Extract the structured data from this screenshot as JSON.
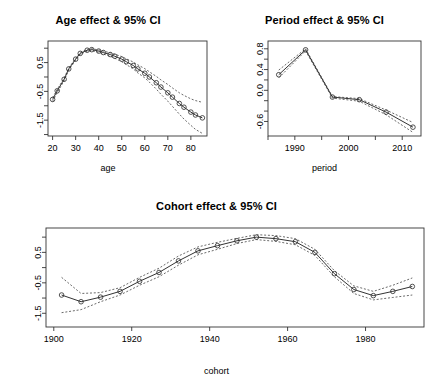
{
  "figure": {
    "background": "#ffffff",
    "foreground": "#000000",
    "line_color": "#333333",
    "ci_color": "#444444"
  },
  "chart_data": [
    {
      "type": "line",
      "id": "age-effect",
      "title": "Age effect & 95% CI",
      "xlabel": "age",
      "ylabel": "",
      "xlim": [
        18,
        87
      ],
      "ylim": [
        -2.05,
        1.25
      ],
      "xticks": [
        20,
        30,
        40,
        50,
        60,
        70,
        80
      ],
      "xticklabels": [
        "20",
        "30",
        "40",
        "50",
        "60",
        "70",
        "80"
      ],
      "yticks": [
        -1.5,
        -0.5,
        0.5
      ],
      "yticklabels": [
        "-1.5",
        "-0.5",
        "0.5"
      ],
      "yminorticks": [
        -2.0,
        -1.0,
        0.0,
        1.0
      ],
      "grid": false,
      "legend": "none",
      "x": [
        20,
        22,
        25,
        27,
        30,
        32,
        35,
        37,
        40,
        42,
        45,
        47,
        50,
        52,
        55,
        57,
        60,
        62,
        65,
        67,
        70,
        72,
        75,
        77,
        80,
        82,
        85
      ],
      "series": [
        {
          "name": "estimate",
          "values": [
            -0.78,
            -0.48,
            -0.08,
            0.28,
            0.62,
            0.82,
            0.93,
            0.95,
            0.9,
            0.85,
            0.78,
            0.72,
            0.62,
            0.53,
            0.4,
            0.28,
            0.13,
            0.0,
            -0.2,
            -0.35,
            -0.55,
            -0.7,
            -0.92,
            -1.05,
            -1.22,
            -1.32,
            -1.42
          ]
        },
        {
          "name": "ci_upper",
          "values": [
            -0.72,
            -0.43,
            -0.04,
            0.31,
            0.65,
            0.85,
            0.96,
            0.98,
            0.94,
            0.9,
            0.84,
            0.79,
            0.71,
            0.63,
            0.52,
            0.42,
            0.29,
            0.18,
            0.02,
            -0.1,
            -0.26,
            -0.38,
            -0.55,
            -0.64,
            -0.76,
            -0.82,
            -0.88
          ]
        },
        {
          "name": "ci_lower",
          "values": [
            -0.85,
            -0.54,
            -0.13,
            0.24,
            0.58,
            0.79,
            0.9,
            0.92,
            0.86,
            0.8,
            0.72,
            0.65,
            0.53,
            0.43,
            0.28,
            0.14,
            -0.03,
            -0.18,
            -0.42,
            -0.6,
            -0.84,
            -1.02,
            -1.29,
            -1.46,
            -1.68,
            -1.82,
            -1.96
          ]
        }
      ]
    },
    {
      "type": "line",
      "id": "period-effect",
      "title": "Period effect & 95% CI",
      "xlabel": "period",
      "ylabel": "",
      "xlim": [
        1985.0,
        2013.5
      ],
      "ylim": [
        -0.88,
        0.95
      ],
      "xticks": [
        1990,
        2000,
        2010
      ],
      "xticklabels": [
        "1990",
        "2000",
        "2010"
      ],
      "xminorticks": [
        1985,
        1995,
        2005
      ],
      "yticks": [
        -0.6,
        0.0,
        0.4,
        0.8
      ],
      "yticklabels": [
        "-0.6",
        "0.0",
        "0.4",
        "0.8"
      ],
      "yminorticks": [
        -0.4,
        -0.2,
        0.2,
        0.6
      ],
      "grid": false,
      "legend": "none",
      "x": [
        1987,
        1992,
        1997,
        2002,
        2007,
        2012
      ],
      "series": [
        {
          "name": "estimate",
          "values": [
            0.3,
            0.78,
            -0.13,
            -0.18,
            -0.42,
            -0.71
          ]
        },
        {
          "name": "ci_upper",
          "values": [
            0.39,
            0.8,
            -0.12,
            -0.16,
            -0.38,
            -0.62
          ]
        },
        {
          "name": "ci_lower",
          "values": [
            0.24,
            0.76,
            -0.15,
            -0.21,
            -0.47,
            -0.81
          ]
        }
      ]
    },
    {
      "type": "line",
      "id": "cohort-effect",
      "title": "Cohort effect & 95% CI",
      "xlabel": "cohort",
      "ylabel": "",
      "xlim": [
        1898,
        1995
      ],
      "ylim": [
        -1.95,
        1.3
      ],
      "xticks": [
        1900,
        1920,
        1940,
        1960,
        1980
      ],
      "xticklabels": [
        "1900",
        "1920",
        "1940",
        "1960",
        "1980"
      ],
      "yticks": [
        -1.5,
        -0.5,
        0.5
      ],
      "yticklabels": [
        "-1.5",
        "-0.5",
        "0.5"
      ],
      "yminorticks": [
        -1.0,
        0.0,
        1.0
      ],
      "grid": false,
      "legend": "none",
      "x": [
        1902,
        1907,
        1912,
        1917,
        1922,
        1927,
        1932,
        1937,
        1942,
        1947,
        1952,
        1957,
        1962,
        1967,
        1972,
        1977,
        1982,
        1987,
        1992
      ],
      "series": [
        {
          "name": "estimate",
          "values": [
            -0.9,
            -1.12,
            -0.97,
            -0.78,
            -0.45,
            -0.16,
            0.22,
            0.55,
            0.72,
            0.88,
            1.0,
            0.95,
            0.85,
            0.5,
            -0.2,
            -0.72,
            -0.92,
            -0.78,
            -0.62
          ]
        },
        {
          "name": "ci_upper",
          "values": [
            -0.32,
            -0.85,
            -0.82,
            -0.66,
            -0.32,
            -0.02,
            0.38,
            0.68,
            0.83,
            0.96,
            1.08,
            1.05,
            0.95,
            0.6,
            -0.1,
            -0.6,
            -0.78,
            -0.58,
            -0.34
          ]
        },
        {
          "name": "ci_lower",
          "values": [
            -1.48,
            -1.38,
            -1.12,
            -0.9,
            -0.58,
            -0.3,
            0.08,
            0.42,
            0.6,
            0.79,
            0.92,
            0.86,
            0.75,
            0.4,
            -0.3,
            -0.85,
            -1.06,
            -0.98,
            -0.9
          ]
        }
      ]
    }
  ]
}
